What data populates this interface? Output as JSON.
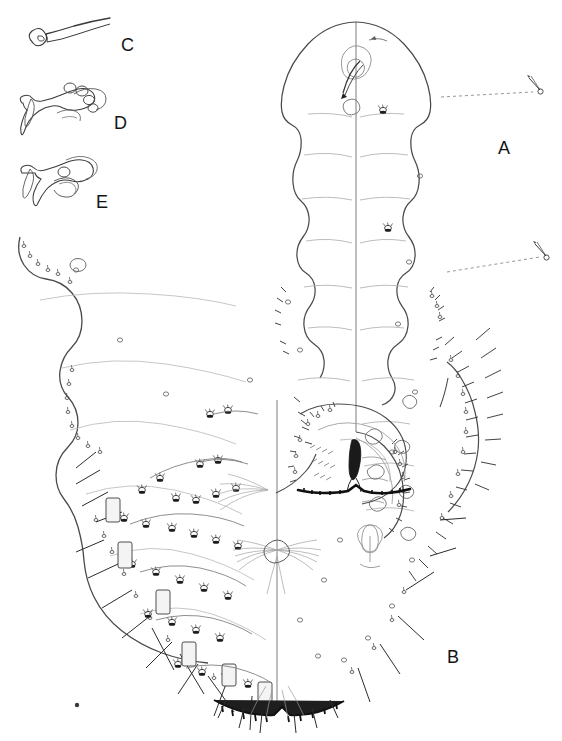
{
  "figure": {
    "type": "scientific-line-drawing",
    "background_color": "#ffffff",
    "ink_color": "#2b2b2b",
    "faint_ink_color": "#9a9a9a",
    "width_px": 562,
    "height_px": 741
  },
  "labels": [
    {
      "id": "C",
      "text": "C",
      "x": 121,
      "y": 36,
      "size": "big",
      "refers_to": "detached clavate seta / whip-like seta with bulbous base"
    },
    {
      "id": "D",
      "text": "D",
      "x": 114,
      "y": 114,
      "size": "big",
      "refers_to": "gnathosomal / cheliceral structure with four rounded lobes"
    },
    {
      "id": "E",
      "text": "E",
      "x": 96,
      "y": 193,
      "size": "big",
      "refers_to": "gnathosomal / cheliceral structure with single rounded lobe"
    },
    {
      "id": "A",
      "text": "A",
      "x": 498,
      "y": 139,
      "size": "big",
      "refers_to": "right half of body, unengorged / normal outline"
    },
    {
      "id": "B",
      "text": "B",
      "x": 447,
      "y": 648,
      "size": "big",
      "refers_to": "left half of body, expanded posterior region"
    }
  ],
  "callouts": [
    {
      "name": "upper-seta-callout",
      "leader": "dashed",
      "from_x": 441,
      "from_y": 97,
      "to_x": 533,
      "to_y": 92,
      "detail": "enlarged solenidion / seta with basal ring"
    },
    {
      "name": "lower-seta-callout",
      "leader": "dashed",
      "from_x": 447,
      "from_y": 272,
      "to_x": 540,
      "to_y": 257,
      "detail": "enlarged solenidion / seta with basal ring"
    }
  ],
  "parts": {
    "midline_upper_x": 356,
    "midline_lower_x": 277,
    "body_apex_y": 22,
    "body_base_y": 716,
    "anal_notch": {
      "x": 355,
      "y": 492
    },
    "genital_fan": {
      "x": 280,
      "y": 555
    },
    "stray_dot": {
      "x": 77,
      "y": 705
    }
  },
  "panel_notes": {
    "A_description": "narrow, segmented right half of idiosoma with marginal spine-like setae",
    "B_description": "broadly expanded left half with dense marginal setae, glandular pores and long barbed spines",
    "C_description": "isolated elongate whip seta with enlarged rounded base",
    "D_description": "ventral gnathosoma bearing four circular pores",
    "E_description": "ventral gnathosoma bearing a single circular pore"
  }
}
